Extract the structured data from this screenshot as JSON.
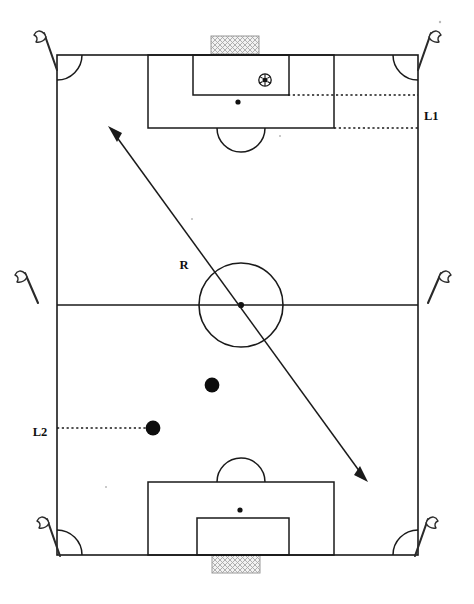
{
  "diagram": {
    "sport": "soccer",
    "orientation": "portrait",
    "background_color": "#ffffff",
    "line_color": "#1a1a1a"
  },
  "labels": {
    "l1": "L1",
    "l2": "L2",
    "r": "R"
  },
  "pitch": {
    "left": 57,
    "top": 55,
    "right": 418,
    "bottom": 555,
    "halfway_y": 305,
    "center_x": 241,
    "center_circle_radius": 42,
    "center_spot_radius": 3.1
  },
  "top_goal": {
    "penalty_area": {
      "x": 148,
      "y": 55,
      "width": 186,
      "height": 73
    },
    "goal_area": {
      "x": 193,
      "y": 55,
      "width": 96,
      "height": 40
    },
    "penalty_spot": {
      "cx": 238,
      "cy": 102,
      "r": 2.6
    },
    "penalty_arc": {
      "cx": 241,
      "cy": 128,
      "r": 24
    },
    "net": {
      "x": 211,
      "y": 36,
      "width": 48,
      "height": 18
    }
  },
  "bottom_goal": {
    "penalty_area": {
      "x": 148,
      "y": 482,
      "width": 186,
      "height": 73
    },
    "goal_area": {
      "x": 197,
      "y": 518,
      "width": 92,
      "height": 37
    },
    "penalty_spot": {
      "cx": 240,
      "cy": 510,
      "r": 2.6
    },
    "penalty_arc": {
      "cx": 241,
      "cy": 482,
      "r": 24
    },
    "net": {
      "x": 212,
      "y": 555,
      "width": 48,
      "height": 18
    }
  },
  "ball": {
    "cx": 265,
    "cy": 80,
    "r": 6.2,
    "icon": "soccer-ball-icon"
  },
  "players": [
    {
      "cx": 212,
      "cy": 385,
      "r": 7.4
    },
    {
      "cx": 153,
      "cy": 428,
      "r": 7.4
    }
  ],
  "dotted_lines": [
    {
      "name": "l1-upper",
      "x1": 288,
      "y1": 95,
      "x2": 418,
      "y2": 95
    },
    {
      "name": "l1-lower",
      "x1": 334,
      "y1": 128,
      "x2": 418,
      "y2": 128
    },
    {
      "name": "l2-leader",
      "x1": 57,
      "y1": 428,
      "x2": 153,
      "y2": 428
    }
  ],
  "arrow": {
    "name": "diagonal-run-arrow",
    "x1": 110,
    "y1": 128,
    "x2": 366,
    "y2": 480,
    "double_headed": true,
    "label": "R",
    "label_x": 184,
    "label_y": 266
  },
  "corner_flags": [
    {
      "name": "corner-flag-top-left",
      "x": 57,
      "y": 55,
      "side": "left"
    },
    {
      "name": "corner-flag-top-right",
      "x": 418,
      "y": 55,
      "side": "right"
    },
    {
      "name": "corner-flag-bottom-left",
      "x": 57,
      "y": 555,
      "side": "left"
    },
    {
      "name": "corner-flag-bottom-right",
      "x": 418,
      "y": 555,
      "side": "right"
    }
  ],
  "halfway_flags": [
    {
      "name": "halfway-flag-left",
      "x": 40,
      "y": 305,
      "side": "left"
    },
    {
      "name": "halfway-flag-right",
      "x": 436,
      "y": 305,
      "side": "right"
    }
  ],
  "label_positions": {
    "l1": {
      "x": 425,
      "y": 117
    },
    "l2": {
      "x": 40,
      "y": 433
    }
  }
}
